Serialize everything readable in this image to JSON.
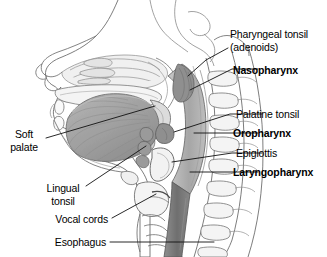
{
  "figure": {
    "background_color": "#ffffff",
    "line_color": "#3c3c3c",
    "leader_color": "#1a1a1a"
  },
  "labels": {
    "pharyngeal_tonsil_line1": "Pharyngeal tonsil",
    "pharyngeal_tonsil_line2": "(adenoids)",
    "nasopharynx": "Nasopharynx",
    "palatine_tonsil": "Palatine tonsil",
    "oropharynx": "Oropharynx",
    "epiglottis": "Epiglottis",
    "laryngopharynx": "Laryngopharynx",
    "soft_palate_line1": "Soft",
    "soft_palate_line2": "palate",
    "lingual_tonsil_line1": "Lingual",
    "lingual_tonsil_line2": "tonsil",
    "vocal_cords": "Vocal cords",
    "esophagus": "Esophagus"
  },
  "palette": {
    "outline": "#4a4a4a",
    "faint_outline": "#9a9a9a",
    "tongue_fill": "#a8a8a8",
    "tongue_shadow": "#8c8c8c",
    "airway_fill": "#b8b8b8",
    "pharynx_fill": "#a0a0a0",
    "esophagus_fill": "#7d7d7d",
    "soft_tissue": "#d6d6d6",
    "bone_fill": "#f2f2f2",
    "vertebra_fill": "#ededed"
  }
}
